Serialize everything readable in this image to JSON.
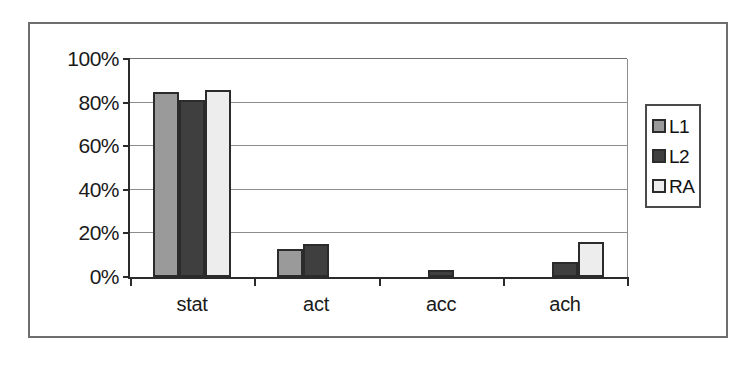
{
  "chart_data": {
    "type": "bar",
    "title": "",
    "subtitle": "",
    "xlabel": "",
    "ylabel": "",
    "categories": [
      "stat",
      "act",
      "acc",
      "ach"
    ],
    "series": [
      {
        "name": "L1",
        "color": "#9a9a9a",
        "values": [
          85,
          13,
          0,
          0
        ]
      },
      {
        "name": "L2",
        "color": "#3f3f3f",
        "values": [
          81,
          15,
          3,
          7
        ]
      },
      {
        "name": "RA",
        "color": "#ededed",
        "values": [
          86,
          0,
          0,
          16
        ]
      }
    ],
    "ylim": [
      0,
      100
    ],
    "y_ticks": [
      0,
      20,
      40,
      60,
      80,
      100
    ],
    "y_tick_labels": [
      "0%",
      "20%",
      "40%",
      "60%",
      "80%",
      "100%"
    ],
    "grid": true,
    "grid_axis": "y",
    "legend_position": "right",
    "value_suffix": "%"
  },
  "legend": {
    "entries": [
      {
        "label": "L1"
      },
      {
        "label": "L2"
      },
      {
        "label": "RA"
      }
    ]
  },
  "axes": {
    "y": {
      "labels": [
        "100%",
        "80%",
        "60%",
        "40%",
        "20%",
        "0%"
      ]
    },
    "x": {
      "labels": [
        "stat",
        "act",
        "acc",
        "ach"
      ]
    }
  }
}
